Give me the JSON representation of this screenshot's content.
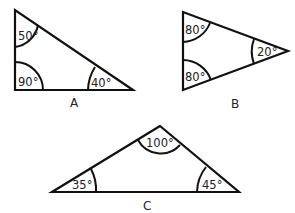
{
  "diagram": {
    "triangles": [
      {
        "label": "A",
        "vertices": [
          [
            15,
            10
          ],
          [
            15,
            90
          ],
          [
            133,
            90
          ]
        ],
        "angles": [
          "50°",
          "90°",
          "40°"
        ]
      },
      {
        "label": "B",
        "vertices": [
          [
            183,
            12
          ],
          [
            183,
            90
          ],
          [
            288,
            51
          ]
        ],
        "angles": [
          "80°",
          "80°",
          "20°"
        ]
      },
      {
        "label": "C",
        "vertices": [
          [
            160,
            126
          ],
          [
            52,
            192
          ],
          [
            239,
            192
          ]
        ],
        "angles": [
          "100°",
          "35°",
          "45°"
        ]
      }
    ]
  }
}
